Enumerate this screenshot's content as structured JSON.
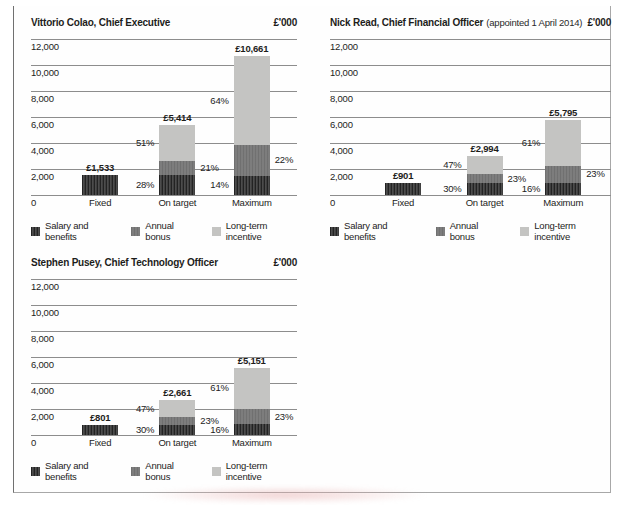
{
  "colors": {
    "salary": "#3f3f3f",
    "bonus": "#7d7d7d",
    "lti": "#c4c4c2",
    "gridline": "#8d8d8d",
    "text": "#1d1d1b"
  },
  "chart_data": [
    {
      "type": "bar",
      "stacked": true,
      "title": "Vittorio Colao, Chief Executive",
      "title_note": "",
      "unit": "£'000",
      "ylabel": "£'000",
      "grid": true,
      "legend_position": "bottom",
      "ylim": [
        0,
        12000
      ],
      "yticks": [
        {
          "value": 12000,
          "label": "12,000"
        },
        {
          "value": 10000,
          "label": "10,000"
        },
        {
          "value": 8000,
          "label": "8,000"
        },
        {
          "value": 6000,
          "label": "6,000"
        },
        {
          "value": 4000,
          "label": "4,000"
        },
        {
          "value": 2000,
          "label": "2,000"
        },
        {
          "value": 0,
          "label": "0"
        }
      ],
      "categories": [
        "Fixed",
        "On target",
        "Maximum"
      ],
      "legend": [
        {
          "series": "salary",
          "label": "Salary and benefits"
        },
        {
          "series": "bonus",
          "label": "Annual bonus"
        },
        {
          "series": "lti",
          "label": "Long-term incentive"
        }
      ],
      "bars": [
        {
          "category": "Fixed",
          "total": 1533,
          "total_label": "£1,533",
          "segments": [
            {
              "series": "salary",
              "pct": 100,
              "pct_label": null,
              "side": null
            }
          ]
        },
        {
          "category": "On target",
          "total": 5414,
          "total_label": "£5,414",
          "segments": [
            {
              "series": "salary",
              "pct": 28,
              "pct_label": "28%",
              "side": "left"
            },
            {
              "series": "bonus",
              "pct": 21,
              "pct_label": "21%",
              "side": "right"
            },
            {
              "series": "lti",
              "pct": 51,
              "pct_label": "51%",
              "side": "left"
            }
          ]
        },
        {
          "category": "Maximum",
          "total": 10661,
          "total_label": "£10,661",
          "segments": [
            {
              "series": "salary",
              "pct": 14,
              "pct_label": "14%",
              "side": "left"
            },
            {
              "series": "bonus",
              "pct": 22,
              "pct_label": "22%",
              "side": "right"
            },
            {
              "series": "lti",
              "pct": 64,
              "pct_label": "64%",
              "side": "left"
            }
          ]
        }
      ]
    },
    {
      "type": "bar",
      "stacked": true,
      "title": "Nick Read, Chief Financial Officer",
      "title_note": "(appointed 1 April 2014)",
      "unit": "£'000",
      "ylabel": "£'000",
      "grid": true,
      "legend_position": "bottom",
      "ylim": [
        0,
        12000
      ],
      "yticks": [
        {
          "value": 12000,
          "label": "12,000"
        },
        {
          "value": 10000,
          "label": "10,000"
        },
        {
          "value": 8000,
          "label": "8,000"
        },
        {
          "value": 6000,
          "label": "6,000"
        },
        {
          "value": 4000,
          "label": "4,000"
        },
        {
          "value": 2000,
          "label": "2,000"
        },
        {
          "value": 0,
          "label": "0"
        }
      ],
      "categories": [
        "Fixed",
        "On target",
        "Maximum"
      ],
      "legend": [
        {
          "series": "salary",
          "label": "Salary and benefits"
        },
        {
          "series": "bonus",
          "label": "Annual bonus"
        },
        {
          "series": "lti",
          "label": "Long-term incentive"
        }
      ],
      "bars": [
        {
          "category": "Fixed",
          "total": 901,
          "total_label": "£901",
          "segments": [
            {
              "series": "salary",
              "pct": 100,
              "pct_label": null,
              "side": null
            }
          ]
        },
        {
          "category": "On target",
          "total": 2994,
          "total_label": "£2,994",
          "segments": [
            {
              "series": "salary",
              "pct": 30,
              "pct_label": "30%",
              "side": "left"
            },
            {
              "series": "bonus",
              "pct": 23,
              "pct_label": "23%",
              "side": "right"
            },
            {
              "series": "lti",
              "pct": 47,
              "pct_label": "47%",
              "side": "left"
            }
          ]
        },
        {
          "category": "Maximum",
          "total": 5795,
          "total_label": "£5,795",
          "segments": [
            {
              "series": "salary",
              "pct": 16,
              "pct_label": "16%",
              "side": "left"
            },
            {
              "series": "bonus",
              "pct": 23,
              "pct_label": "23%",
              "side": "right"
            },
            {
              "series": "lti",
              "pct": 61,
              "pct_label": "61%",
              "side": "left"
            }
          ]
        }
      ]
    },
    {
      "type": "bar",
      "stacked": true,
      "title": "Stephen Pusey, Chief Technology Officer",
      "title_note": "",
      "unit": "£'000",
      "ylabel": "£'000",
      "grid": true,
      "legend_position": "bottom",
      "ylim": [
        0,
        12000
      ],
      "yticks": [
        {
          "value": 12000,
          "label": "12,000"
        },
        {
          "value": 10000,
          "label": "10,000"
        },
        {
          "value": 8000,
          "label": "8,000"
        },
        {
          "value": 6000,
          "label": "6,000"
        },
        {
          "value": 4000,
          "label": "4,000"
        },
        {
          "value": 2000,
          "label": "2,000"
        },
        {
          "value": 0,
          "label": "0"
        }
      ],
      "categories": [
        "Fixed",
        "On target",
        "Maximum"
      ],
      "legend": [
        {
          "series": "salary",
          "label": "Salary and benefits"
        },
        {
          "series": "bonus",
          "label": "Annual bonus"
        },
        {
          "series": "lti",
          "label": "Long-term incentive"
        }
      ],
      "bars": [
        {
          "category": "Fixed",
          "total": 801,
          "total_label": "£801",
          "segments": [
            {
              "series": "salary",
              "pct": 100,
              "pct_label": null,
              "side": null
            }
          ]
        },
        {
          "category": "On target",
          "total": 2661,
          "total_label": "£2,661",
          "segments": [
            {
              "series": "salary",
              "pct": 30,
              "pct_label": "30%",
              "side": "left"
            },
            {
              "series": "bonus",
              "pct": 23,
              "pct_label": "23%",
              "side": "right"
            },
            {
              "series": "lti",
              "pct": 47,
              "pct_label": "47%",
              "side": "left"
            }
          ]
        },
        {
          "category": "Maximum",
          "total": 5151,
          "total_label": "£5,151",
          "segments": [
            {
              "series": "salary",
              "pct": 16,
              "pct_label": "16%",
              "side": "left"
            },
            {
              "series": "bonus",
              "pct": 23,
              "pct_label": "23%",
              "side": "right"
            },
            {
              "series": "lti",
              "pct": 61,
              "pct_label": "61%",
              "side": "left"
            }
          ]
        }
      ]
    }
  ]
}
